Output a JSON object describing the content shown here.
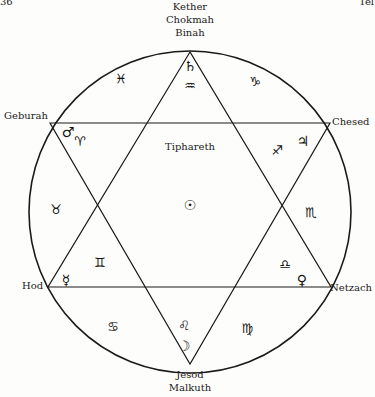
{
  "page_corner": {
    "left": "36",
    "right": "Tel"
  },
  "sephiroth": {
    "top": [
      "Kether",
      "Chokmah",
      "Binah"
    ],
    "upper_left": "Geburah",
    "upper_right": "Chesed",
    "lower_left": "Hod",
    "lower_right": "Netzach",
    "bottom": [
      "Jesod",
      "Malkuth"
    ],
    "center": "Tiphareth"
  },
  "planets": {
    "top": "♄",
    "upper_left": "♂",
    "upper_right": "♃",
    "lower_left": "☿",
    "lower_right": "♀",
    "bottom": "☽",
    "center": "☉"
  },
  "signs": {
    "aquarius": "♒",
    "pisces": "♓",
    "capricorn": "♑",
    "aries": "♈",
    "sagittarius": "♐",
    "taurus": "♉",
    "scorpio": "♏",
    "gemini": "♊",
    "libra": "♎",
    "cancer": "♋",
    "leo": "♌",
    "virgo": "♍"
  },
  "colors": {
    "line": "#1a1a1a",
    "background": "#fdfdfb"
  }
}
